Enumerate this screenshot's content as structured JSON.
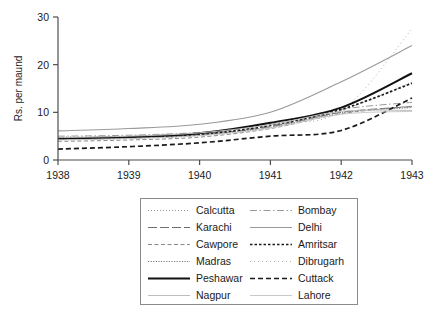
{
  "chart_data": {
    "type": "line",
    "title": "",
    "subtitle": "",
    "xlabel": "",
    "ylabel": "Rs. per maund",
    "x": [
      1938,
      1939,
      1940,
      1941,
      1942,
      1943
    ],
    "xticklabels": [
      "1938",
      "1939",
      "1940",
      "1941",
      "1942",
      "1943"
    ],
    "yticklabels": [
      "0",
      "10",
      "20",
      "30"
    ],
    "yticks": [
      0,
      10,
      20,
      30
    ],
    "xlim": [
      1938,
      1943
    ],
    "ylim": [
      0,
      30
    ],
    "grid": false,
    "legend_position": "below-plot",
    "legend_columns": 2,
    "series": [
      {
        "name": "Calcutta",
        "style": "dotted-fine",
        "color": "#9a9a9a",
        "width": 1.0,
        "values": [
          4.6,
          4.8,
          5.4,
          6.9,
          10.4,
          16.3
        ]
      },
      {
        "name": "Bombay",
        "style": "dash-dot",
        "color": "#9a9a9a",
        "width": 1.0,
        "values": [
          5.0,
          5.2,
          5.8,
          7.2,
          10.6,
          12.1
        ]
      },
      {
        "name": "Karachi",
        "style": "long-dash",
        "color": "#6f6f6f",
        "width": 1.0,
        "values": [
          4.3,
          4.6,
          5.3,
          7.0,
          10.0,
          11.2
        ]
      },
      {
        "name": "Delhi",
        "style": "solid-light",
        "color": "#9a9a9a",
        "width": 1.1,
        "values": [
          6.1,
          6.6,
          7.5,
          10.0,
          16.4,
          24.0
        ]
      },
      {
        "name": "Cawpore",
        "style": "dash-small",
        "color": "#8a8a8a",
        "width": 1.0,
        "values": [
          3.9,
          4.2,
          4.8,
          6.6,
          9.7,
          11.3
        ]
      },
      {
        "name": "Amritsar",
        "style": "dot-dash-bold",
        "color": "#1a1a1a",
        "width": 1.7,
        "values": [
          4.6,
          4.7,
          5.3,
          7.3,
          10.6,
          16.1
        ]
      },
      {
        "name": "Madras",
        "style": "dotted-dense",
        "color": "#7a7a7a",
        "width": 1.0,
        "values": [
          4.4,
          4.6,
          5.2,
          6.8,
          9.9,
          11.0
        ]
      },
      {
        "name": "Dibrugarh",
        "style": "dotted-sparse",
        "color": "#b0b0b0",
        "width": 1.0,
        "values": [
          4.9,
          5.0,
          5.6,
          7.6,
          10.3,
          27.5
        ]
      },
      {
        "name": "Peshawar",
        "style": "solid-bold",
        "color": "#111111",
        "width": 2.0,
        "values": [
          4.5,
          4.8,
          5.6,
          7.8,
          11.0,
          18.2
        ]
      },
      {
        "name": "Cuttack",
        "style": "dashed-bold",
        "color": "#1a1a1a",
        "width": 1.7,
        "values": [
          2.3,
          2.8,
          3.6,
          5.0,
          6.2,
          13.0
        ]
      },
      {
        "name": "Nagpur",
        "style": "solid-faint",
        "color": "#bdbdbd",
        "width": 1.0,
        "values": [
          4.7,
          5.0,
          5.7,
          7.4,
          10.2,
          10.4
        ]
      },
      {
        "name": "Lahore",
        "style": "solid-pale",
        "color": "#c9c9c9",
        "width": 1.0,
        "values": [
          4.2,
          4.5,
          5.1,
          6.7,
          9.6,
          10.2
        ]
      }
    ]
  },
  "legend": {
    "items": [
      {
        "label": "Calcutta"
      },
      {
        "label": "Bombay"
      },
      {
        "label": "Karachi"
      },
      {
        "label": "Delhi"
      },
      {
        "label": "Cawpore"
      },
      {
        "label": "Amritsar"
      },
      {
        "label": "Madras"
      },
      {
        "label": "Dibrugarh"
      },
      {
        "label": "Peshawar"
      },
      {
        "label": "Cuttack"
      },
      {
        "label": "Nagpur"
      },
      {
        "label": "Lahore"
      }
    ]
  },
  "axes": {
    "y_title": "Rs. per maund",
    "y_ticks": [
      "30",
      "20",
      "10",
      "0"
    ],
    "x_ticks": [
      "1938",
      "1939",
      "1940",
      "1941",
      "1942",
      "1943"
    ]
  },
  "colors": {
    "axis": "#4d4d4d",
    "text": "#1a1a1a",
    "legend_border": "#8a8a8a",
    "background": "#ffffff"
  }
}
